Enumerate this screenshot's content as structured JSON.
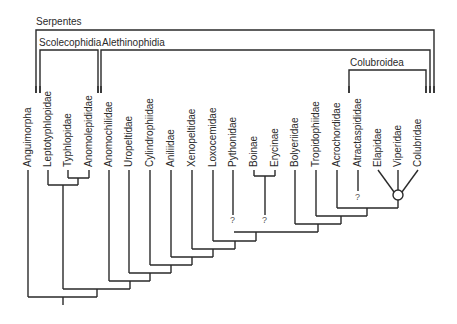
{
  "groups": {
    "serpentes": "Serpentes",
    "scolecophidia": "Scolecophidia",
    "alethinophidia": "Alethinophidia",
    "colubroidea": "Colubroidea"
  },
  "taxa": [
    {
      "name": "Anguimorpha",
      "x": 28
    },
    {
      "name": "Leptotyphlopidae",
      "x": 48
    },
    {
      "name": "Typhlopidae",
      "x": 68
    },
    {
      "name": "Anomolepididae",
      "x": 89
    },
    {
      "name": "Anomochilidae",
      "x": 109
    },
    {
      "name": "Uropeltidae",
      "x": 129
    },
    {
      "name": "Cylindrophiidae",
      "x": 150
    },
    {
      "name": "Aniliidae",
      "x": 171
    },
    {
      "name": "Xenopeltidae",
      "x": 192
    },
    {
      "name": "Loxocemidae",
      "x": 213
    },
    {
      "name": "Pythonidae",
      "x": 233
    },
    {
      "name": "Boinae",
      "x": 254
    },
    {
      "name": "Erycinae",
      "x": 275
    },
    {
      "name": "Bolyeriidae",
      "x": 295
    },
    {
      "name": "Tropidophiidae",
      "x": 316
    },
    {
      "name": "Acrochordidae",
      "x": 337
    },
    {
      "name": "Atractaspididae",
      "x": 358
    },
    {
      "name": "Elapidae",
      "x": 378
    },
    {
      "name": "Viperidae",
      "x": 398
    },
    {
      "name": "Colubridae",
      "x": 418
    }
  ],
  "uncertain_marks": [
    {
      "label": "?",
      "x": 233,
      "y": 222
    },
    {
      "label": "?",
      "x": 265,
      "y": 222
    },
    {
      "label": "?",
      "x": 358,
      "y": 199
    }
  ]
}
